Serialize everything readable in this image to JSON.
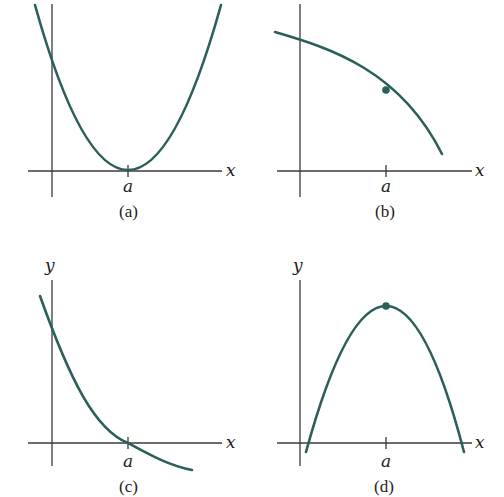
{
  "colors": {
    "curve": "#2a5f5a",
    "axis": "#3a3a3a",
    "text": "#222222"
  },
  "panels": [
    {
      "caption": "(a)",
      "x_axis_label": "x",
      "y_axis_label": "y",
      "tick_label": "a",
      "description": "Upward-opening parabola with minimum touching x-axis at x = a"
    },
    {
      "caption": "(b)",
      "x_axis_label": "x",
      "y_axis_label": "y",
      "tick_label": "a",
      "description": "Decreasing, concave-down curve with a marked point above x = a"
    },
    {
      "caption": "(c)",
      "x_axis_label": "x",
      "y_axis_label": "y",
      "tick_label": "a",
      "description": "Decreasing, concave-up curve crossing x-axis at x = a"
    },
    {
      "caption": "(d)",
      "x_axis_label": "x",
      "y_axis_label": "y",
      "tick_label": "a",
      "description": "Downward-opening parabola with marked maximum at x = a"
    }
  ]
}
